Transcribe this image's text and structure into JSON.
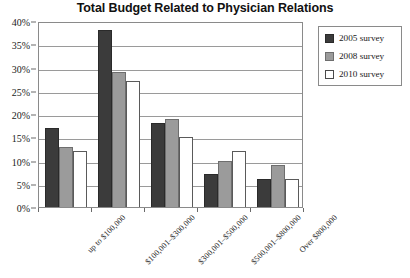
{
  "chart_data": {
    "type": "bar",
    "title": "Total Budget Related to Physician Relations",
    "xlabel": "",
    "ylabel": "",
    "ylim": [
      0,
      40
    ],
    "yticks": [
      "0%",
      "5%",
      "10%",
      "15%",
      "20%",
      "25%",
      "30%",
      "35%",
      "40%"
    ],
    "ytick_values": [
      0,
      5,
      10,
      15,
      20,
      25,
      30,
      35,
      40
    ],
    "grid": true,
    "legend_position": "right",
    "categories": [
      "up to $100,000",
      "$100,001–$300,000",
      "$300,001–$500,000",
      "$500,001–$800,000",
      "Over $800,000"
    ],
    "series": [
      {
        "name": "2005 survey",
        "color": "#3b3b3b",
        "values": [
          17,
          38,
          18,
          7,
          6
        ]
      },
      {
        "name": "2008 survey",
        "color": "#9b9b9b",
        "values": [
          13,
          29,
          19,
          10,
          9
        ]
      },
      {
        "name": "2010 survey",
        "color": "#ffffff",
        "values": [
          12,
          27,
          15,
          12,
          6
        ]
      }
    ]
  }
}
